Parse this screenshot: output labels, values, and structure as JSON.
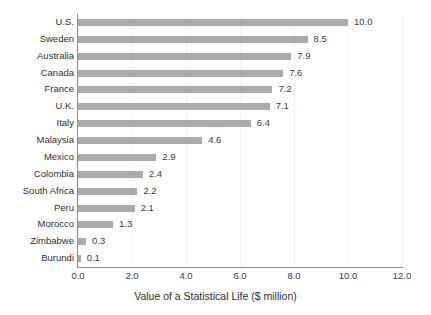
{
  "chart_data": {
    "type": "bar",
    "orientation": "horizontal",
    "title": "",
    "xlabel": "Value of a Statistical Life ($ million)",
    "ylabel": "",
    "xlim": [
      0.0,
      12.0
    ],
    "xticks": [
      "0.0",
      "2.0",
      "4.0",
      "6.0",
      "8.0",
      "10.0",
      "12.0"
    ],
    "xtick_values": [
      0.0,
      2.0,
      4.0,
      6.0,
      8.0,
      10.0,
      12.0
    ],
    "grid": "vertical-faint",
    "legend": "none",
    "bar_color": "#ababab",
    "axis_color": "#8e8e8e",
    "categories": [
      "U.S.",
      "Sweden",
      "Australia",
      "Canada",
      "France",
      "U.K.",
      "Italy",
      "Malaysia",
      "Mexico",
      "Colombia",
      "South Africa",
      "Peru",
      "Morocco",
      "Zimbabwe",
      "Burundi"
    ],
    "values": [
      10.0,
      8.5,
      7.9,
      7.6,
      7.2,
      7.1,
      6.4,
      4.6,
      2.9,
      2.4,
      2.2,
      2.1,
      1.3,
      0.3,
      0.1
    ],
    "data_labels": [
      "10.0",
      "8.5",
      "7.9",
      "7.6",
      "7.2",
      "7.1",
      "6.4",
      "4.6",
      "2.9",
      "2.4",
      "2.2",
      "2.1",
      "1.3",
      "0.3",
      "0.1"
    ]
  }
}
